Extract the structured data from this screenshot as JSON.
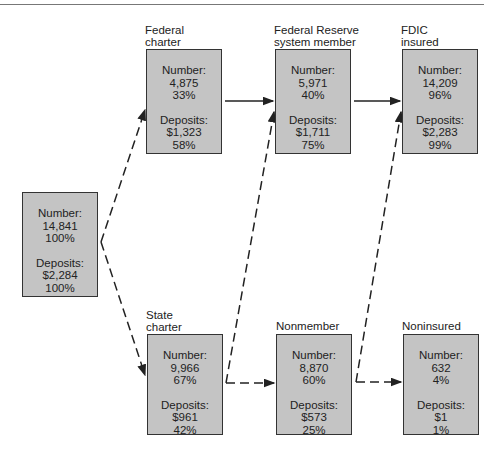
{
  "diagram": {
    "nodes": {
      "all": {
        "label": "",
        "number_label": "Number:",
        "number": "14,841",
        "number_pct": "100%",
        "deposits_label": "Deposits:",
        "deposits": "$2,284",
        "deposits_pct": "100%"
      },
      "federal": {
        "label_line1": "Federal",
        "label_line2": "charter",
        "number_label": "Number:",
        "number": "4,875",
        "number_pct": "33%",
        "deposits_label": "Deposits:",
        "deposits": "$1,323",
        "deposits_pct": "58%"
      },
      "fed_reserve": {
        "label_line1": "Federal Reserve",
        "label_line2": "system member",
        "number_label": "Number:",
        "number": "5,971",
        "number_pct": "40%",
        "deposits_label": "Deposits:",
        "deposits": "$1,711",
        "deposits_pct": "75%"
      },
      "fdic": {
        "label_line1": "FDIC",
        "label_line2": "insured",
        "number_label": "Number:",
        "number": "14,209",
        "number_pct": "96%",
        "deposits_label": "Deposits:",
        "deposits": "$2,283",
        "deposits_pct": "99%"
      },
      "state": {
        "label_line1": "State",
        "label_line2": "charter",
        "number_label": "Number:",
        "number": "9,966",
        "number_pct": "67%",
        "deposits_label": "Deposits:",
        "deposits": "$961",
        "deposits_pct": "42%"
      },
      "nonmember": {
        "label_line1": "Nonmember",
        "number_label": "Number:",
        "number": "8,870",
        "number_pct": "60%",
        "deposits_label": "Deposits:",
        "deposits": "$573",
        "deposits_pct": "25%"
      },
      "noninsured": {
        "label_line1": "Noninsured",
        "number_label": "Number:",
        "number": "632",
        "number_pct": "4%",
        "deposits_label": "Deposits:",
        "deposits": "$1",
        "deposits_pct": "1%"
      }
    },
    "edges": [
      {
        "from": "all",
        "to": "federal",
        "style": "dashed"
      },
      {
        "from": "all",
        "to": "state",
        "style": "dashed"
      },
      {
        "from": "federal",
        "to": "fed_reserve",
        "style": "solid"
      },
      {
        "from": "fed_reserve",
        "to": "fdic",
        "style": "solid"
      },
      {
        "from": "state",
        "to": "fed_reserve",
        "style": "dashed"
      },
      {
        "from": "state",
        "to": "nonmember",
        "style": "dashed"
      },
      {
        "from": "nonmember",
        "to": "fdic",
        "style": "dashed"
      },
      {
        "from": "nonmember",
        "to": "noninsured",
        "style": "dashed"
      }
    ],
    "colors": {
      "box_fill": "#c4c4c4",
      "border": "#333333"
    }
  }
}
